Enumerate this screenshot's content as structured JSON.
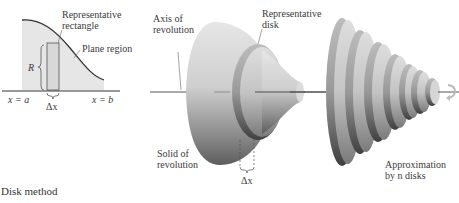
{
  "figure": {
    "caption": "Disk method",
    "panel_left": {
      "labels": {
        "representative_rectangle_1": "Representative",
        "representative_rectangle_2": "rectangle",
        "plane_region": "Plane region",
        "radius": "R",
        "x_left": "x = a",
        "x_right": "x = b",
        "delta_x": "Δx"
      }
    },
    "panel_middle": {
      "labels": {
        "axis_1": "Axis of",
        "axis_2": "revolution",
        "disk_1": "Representative",
        "disk_2": "disk",
        "solid_1": "Solid of",
        "solid_2": "revolution",
        "delta_x": "Δx"
      }
    },
    "panel_right": {
      "labels": {
        "approx_1": "Approximation",
        "approx_2": "by n disks"
      },
      "disk_count": 7
    },
    "colors": {
      "region_fill": "#e6e6e6",
      "curve": "#333333",
      "solid_light": "#e8e8e8",
      "solid_dark": "#5a5a5a",
      "axis": "#444444"
    }
  }
}
